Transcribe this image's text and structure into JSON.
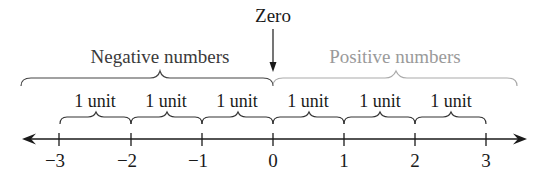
{
  "zero_label": "Zero",
  "groups": {
    "negative": {
      "label": "Negative numbers",
      "color": "#3a3a3a"
    },
    "positive": {
      "label": "Positive numbers",
      "color": "#9a9a9a"
    }
  },
  "units": [
    "1 unit",
    "1 unit",
    "1 unit",
    "1 unit",
    "1 unit",
    "1 unit"
  ],
  "ticks": [
    "−3",
    "−2",
    "−1",
    "0",
    "1",
    "2",
    "3"
  ],
  "colors": {
    "ink": "#1a1a1a",
    "brace": "#444444"
  }
}
